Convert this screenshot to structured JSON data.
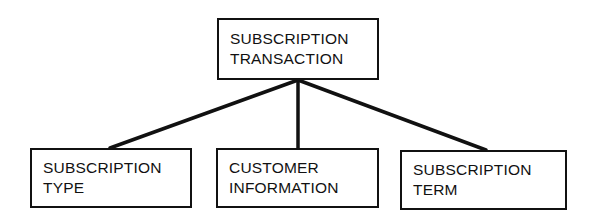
{
  "diagram": {
    "type": "hierarchy-tree",
    "orientation": "top-down",
    "background_color": "#ffffff",
    "line_color": "#111111",
    "box_border_color": "#111111",
    "box_fill_color": "#ffffff",
    "text_color": "#111111",
    "root": {
      "id": "subscription-transaction",
      "line1": "SUBSCRIPTION",
      "line2": "TRANSACTION"
    },
    "children": [
      {
        "id": "subscription-type",
        "line1": "SUBSCRIPTION",
        "line2": "TYPE"
      },
      {
        "id": "customer-information",
        "line1": "CUSTOMER",
        "line2": "INFORMATION"
      },
      {
        "id": "subscription-term",
        "line1": "SUBSCRIPTION",
        "line2": "TERM"
      }
    ],
    "edges": [
      {
        "from": "subscription-transaction",
        "to": "subscription-type"
      },
      {
        "from": "subscription-transaction",
        "to": "customer-information"
      },
      {
        "from": "subscription-transaction",
        "to": "subscription-term"
      }
    ]
  }
}
